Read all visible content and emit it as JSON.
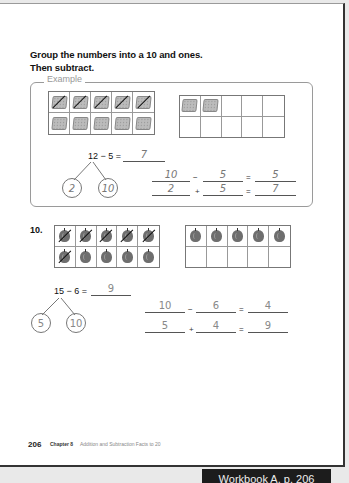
{
  "instructions": {
    "line1": "Group the numbers into a 10 and ones.",
    "line2": "Then subtract."
  },
  "example": {
    "label": "Example",
    "ten_frame_1": {
      "filled": 10,
      "crossed": 5,
      "counter_icon": "square-chip-icon"
    },
    "ten_frame_2": {
      "filled": 2,
      "crossed": 0,
      "counter_icon": "square-chip-icon"
    },
    "equation": "12 − 5 =",
    "answer": "7",
    "bond": {
      "left": "2",
      "right": "10"
    },
    "row1": {
      "a": "10",
      "op": "−",
      "b": "5",
      "eq": "=",
      "result": "5"
    },
    "row2": {
      "a": "2",
      "op": "+",
      "b": "5",
      "eq": "=",
      "result": "7"
    }
  },
  "problem": {
    "number": "10.",
    "ten_frame_1": {
      "filled": 10,
      "crossed": 6,
      "counter_icon": "apple-icon"
    },
    "ten_frame_2": {
      "filled": 5,
      "crossed": 0,
      "counter_icon": "apple-icon"
    },
    "equation": "15 − 6 =",
    "answer": "9",
    "bond": {
      "left": "5",
      "right": "10"
    },
    "row1": {
      "a": "10",
      "op": "−",
      "b": "6",
      "eq": "=",
      "result": "4"
    },
    "row2": {
      "a": "5",
      "op": "+",
      "b": "4",
      "eq": "=",
      "result": "9"
    }
  },
  "footer": {
    "page_number": "206",
    "chapter": "Chapter 8",
    "chapter_title": "Addition and Subtraction Facts to 20"
  },
  "banner": {
    "label": "Workbook A, p. 206"
  }
}
